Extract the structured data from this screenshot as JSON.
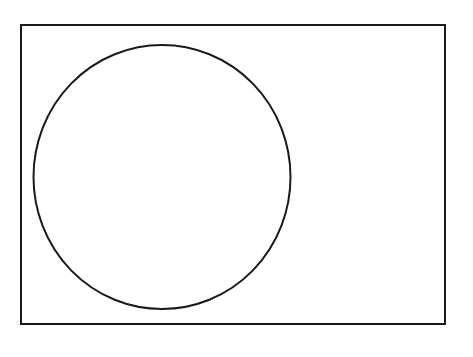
{
  "diagram": {
    "background": "#ffffff",
    "stroke_color": "#1a1a1a",
    "rectangle": {
      "x": 21,
      "y": 25,
      "width": 424,
      "height": 299,
      "stroke_width": 2
    },
    "circle": {
      "cx": 162,
      "cy": 177,
      "rx": 128.5,
      "ry": 132,
      "stroke_width": 2
    }
  }
}
